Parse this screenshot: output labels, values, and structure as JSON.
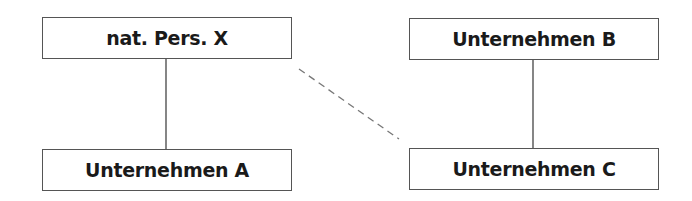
{
  "diagram": {
    "nodes": [
      {
        "id": "X",
        "label": "nat. Pers. X"
      },
      {
        "id": "A",
        "label": "Unternehmen A"
      },
      {
        "id": "B",
        "label": "Unternehmen B"
      },
      {
        "id": "C",
        "label": "Unternehmen C"
      }
    ],
    "edges": [
      {
        "from": "X",
        "to": "A",
        "style": "solid"
      },
      {
        "from": "B",
        "to": "C",
        "style": "solid"
      },
      {
        "from": "X",
        "to": "C",
        "style": "dashed"
      }
    ],
    "colors": {
      "box_border": "#555555",
      "line": "#444444",
      "dashed_line": "#777777",
      "text": "#1a1a1a"
    }
  }
}
